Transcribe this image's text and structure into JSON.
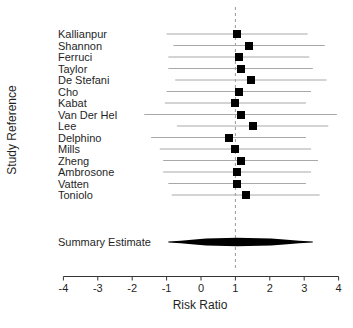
{
  "chart_data": {
    "type": "scatter",
    "subtype": "forest-plot",
    "title": "",
    "xlabel": "Risk Ratio",
    "ylabel": "Study Reference",
    "xlim": [
      -4,
      4
    ],
    "x_ticks": [
      -4,
      -3,
      -2,
      -1,
      0,
      1,
      2,
      3,
      4
    ],
    "grid": false,
    "legend": null,
    "reference_line_x": 1,
    "studies": [
      {
        "label": "Kallianpur",
        "estimate": 1.05,
        "ci_low": -1.0,
        "ci_high": 3.1
      },
      {
        "label": "Shannon",
        "estimate": 1.4,
        "ci_low": -0.8,
        "ci_high": 3.6
      },
      {
        "label": "Ferruci",
        "estimate": 1.1,
        "ci_low": -0.95,
        "ci_high": 3.15
      },
      {
        "label": "Taylor",
        "estimate": 1.15,
        "ci_low": -0.95,
        "ci_high": 3.25
      },
      {
        "label": "De Stefani",
        "estimate": 1.45,
        "ci_low": -0.75,
        "ci_high": 3.65
      },
      {
        "label": "Cho",
        "estimate": 1.1,
        "ci_low": -1.0,
        "ci_high": 3.2
      },
      {
        "label": "Kabat",
        "estimate": 1.0,
        "ci_low": -1.05,
        "ci_high": 3.05
      },
      {
        "label": "Van Der Hel",
        "estimate": 1.15,
        "ci_low": -1.65,
        "ci_high": 3.95
      },
      {
        "label": "Lee",
        "estimate": 1.5,
        "ci_low": -0.7,
        "ci_high": 3.7
      },
      {
        "label": "Delphino",
        "estimate": 0.8,
        "ci_low": -1.45,
        "ci_high": 3.05
      },
      {
        "label": "Mills",
        "estimate": 1.0,
        "ci_low": -1.2,
        "ci_high": 3.2
      },
      {
        "label": "Zheng",
        "estimate": 1.15,
        "ci_low": -1.1,
        "ci_high": 3.4
      },
      {
        "label": "Ambrosone",
        "estimate": 1.05,
        "ci_low": -1.1,
        "ci_high": 3.2
      },
      {
        "label": "Vatten",
        "estimate": 1.05,
        "ci_low": -0.95,
        "ci_high": 3.05
      },
      {
        "label": "Toniolo",
        "estimate": 1.3,
        "ci_low": -0.85,
        "ci_high": 3.45
      }
    ],
    "summary": {
      "label": "Summary Estimate",
      "estimate": 1.05,
      "ci_low": -0.95,
      "ci_high": 3.25
    },
    "colors": {
      "marker": "#000000",
      "ci_line": "#a8a8a8",
      "reference_line": "#9a9a9a",
      "axis": "#333333",
      "text": "#1f1f1f",
      "background": "#ffffff"
    }
  }
}
